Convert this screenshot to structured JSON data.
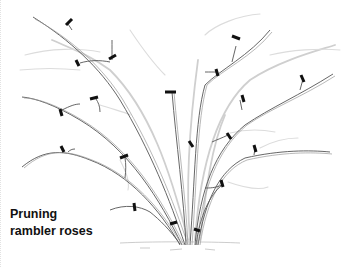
{
  "figure": {
    "caption_line1": "Pruning",
    "caption_line2": "rambler roses",
    "cut_mark_count": 22,
    "colors": {
      "stems": "#555555",
      "old_growth": "#cfcfcf",
      "cut_marks": "#111111"
    }
  }
}
